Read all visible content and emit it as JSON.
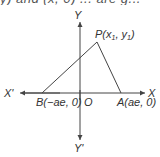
{
  "clipped_top_text": "y) and (x, 0) ... are g...",
  "diagram": {
    "axes": {
      "x_pos_label": "X",
      "x_neg_label": "X'",
      "y_pos_label": "Y",
      "y_neg_label": "Y'",
      "origin_label": "O"
    },
    "points": {
      "P": {
        "name": "P",
        "coords": "(x",
        "sub1": "1",
        "mid": ", y",
        "sub2": "1",
        "end": ")"
      },
      "A": {
        "label": "A(ae, 0)"
      },
      "B": {
        "label": "B(−ae, 0)"
      }
    },
    "shape": "triangle PAB",
    "colors": {
      "line": "#444444",
      "text": "#333333",
      "background": "#ffffff"
    }
  }
}
